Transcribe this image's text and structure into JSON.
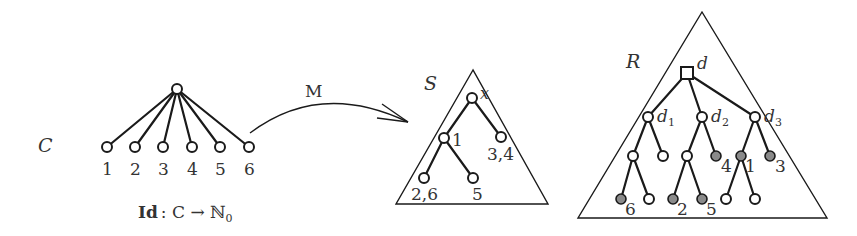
{
  "figure": {
    "tree_C": {
      "name": "C",
      "root": {
        "x": 177,
        "y": 89
      },
      "leaves": [
        {
          "label": "1",
          "x": 107,
          "y": 147
        },
        {
          "label": "2",
          "x": 135,
          "y": 147
        },
        {
          "label": "3",
          "x": 163,
          "y": 147
        },
        {
          "label": "4",
          "x": 192,
          "y": 147
        },
        {
          "label": "5",
          "x": 220,
          "y": 147
        },
        {
          "label": "6",
          "x": 249,
          "y": 147
        }
      ],
      "caption_id": "Id",
      "caption_rest": ": C → ℕ",
      "caption_sub": "0"
    },
    "arrow": {
      "label": "M"
    },
    "tree_S": {
      "name": "S",
      "root_label": "x",
      "node_labels": {
        "n1": "1",
        "n34": "3,4",
        "n26": "2,6",
        "n5": "5"
      }
    },
    "tree_R": {
      "name": "R",
      "root_label": "d",
      "children_labels": [
        {
          "base": "d",
          "sub": "1"
        },
        {
          "base": "d",
          "sub": "2"
        },
        {
          "base": "d",
          "sub": "3"
        }
      ],
      "leaf_labels": {
        "l4": "4",
        "l1": "1",
        "l3": "3",
        "l6": "6",
        "l2": "2",
        "l5": "5"
      }
    },
    "colors": {
      "stroke": "#1a1a1a",
      "filled_node": "#8a8a8a",
      "text": "#333333",
      "background": "#ffffff"
    }
  }
}
